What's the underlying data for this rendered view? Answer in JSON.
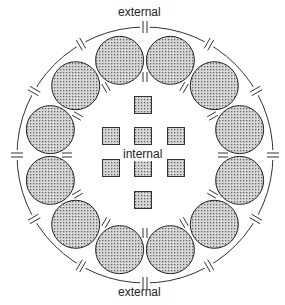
{
  "labels": {
    "top": "external",
    "center": "internal",
    "bottom": "external"
  },
  "diagram": {
    "center": [
      145,
      155
    ],
    "outer_ring_radius": 128,
    "cells": {
      "count": 12,
      "ring_radius": 98,
      "radius": 24
    },
    "inner_squares": [
      [
        143,
        105
      ],
      [
        111,
        136
      ],
      [
        143,
        136
      ],
      [
        176,
        136
      ],
      [
        111,
        168
      ],
      [
        143,
        168
      ],
      [
        176,
        168
      ],
      [
        143,
        200
      ]
    ],
    "square_size": 17,
    "fill_color": "#b8b8b8"
  }
}
